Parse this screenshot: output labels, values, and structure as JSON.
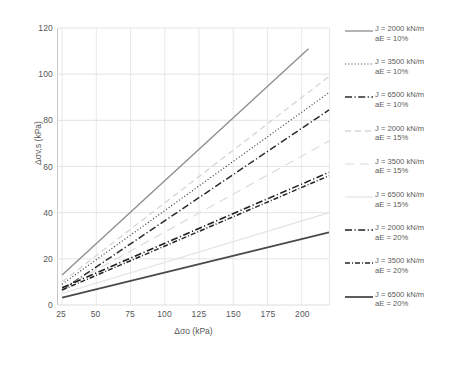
{
  "chart_data": {
    "type": "line",
    "title": "",
    "xlabel": "Δσo (kPa)",
    "ylabel": "Δσv,s (kPa)",
    "xlim": [
      22,
      220
    ],
    "ylim": [
      0,
      120
    ],
    "xticks": [
      25,
      50,
      75,
      100,
      125,
      150,
      175,
      200
    ],
    "yticks": [
      0,
      20,
      40,
      60,
      80,
      100,
      120
    ],
    "grid": true,
    "legend_position": "right",
    "x": [
      25,
      220
    ],
    "series": [
      {
        "name": "J = 2000 kN/m\naE = 10%",
        "label_line1": "J = 2000 kN/m",
        "label_line2": "aE = 10%",
        "J": 2000,
        "aE": "10%",
        "values": [
          13.0,
          120.0
        ],
        "x_end": 205,
        "y_end": 111.0,
        "color": "#8c8c8c",
        "style": "solid",
        "width": 1.3
      },
      {
        "name": "J = 3500 kN/m\naE = 10%",
        "label_line1": "J = 3500 kN/m",
        "label_line2": "aE = 10%",
        "J": 3500,
        "aE": "10%",
        "values": [
          9.0,
          92.0
        ],
        "x_end": 220,
        "y_end": 92.0,
        "color": "#3a3a3a",
        "style": "dotted",
        "width": 1.2
      },
      {
        "name": "J = 6500 kN/m\naE = 10%",
        "label_line1": "J = 6500 kN/m",
        "label_line2": "aE = 10%",
        "J": 6500,
        "aE": "10%",
        "values": [
          6.5,
          84.5
        ],
        "x_end": 220,
        "y_end": 84.5,
        "color": "#2b2b2b",
        "style": "dashdot-bold",
        "width": 1.5
      },
      {
        "name": "J = 2000 kN/m\naE = 15%",
        "label_line1": "J = 2000 kN/m",
        "label_line2": "aE = 15%",
        "J": 2000,
        "aE": "15%",
        "values": [
          10.0,
          99.0
        ],
        "x_end": 220,
        "y_end": 99.0,
        "color": "#d6d6d6",
        "style": "dashed",
        "width": 1.3
      },
      {
        "name": "J = 3500 kN/m\naE = 15%",
        "label_line1": "J = 3500 kN/m",
        "label_line2": "aE = 15%",
        "J": 3500,
        "aE": "15%",
        "values": [
          7.0,
          71.0
        ],
        "x_end": 220,
        "y_end": 71.0,
        "color": "#dcdcdc",
        "style": "dashed-long",
        "width": 1.2
      },
      {
        "name": "J = 6500 kN/m\naE = 15%",
        "label_line1": "J = 6500 kN/m",
        "label_line2": "aE = 15%",
        "J": 6500,
        "aE": "15%",
        "values": [
          5.0,
          40.0
        ],
        "x_end": 220,
        "y_end": 40.0,
        "color": "#e3e3e3",
        "style": "solid-light",
        "width": 1.2
      },
      {
        "name": "J = 2000 kN/m\naE = 20%",
        "label_line1": "J = 2000 kN/m",
        "label_line2": "aE = 20%",
        "J": 2000,
        "aE": "20%",
        "values": [
          7.5,
          57.5
        ],
        "x_end": 220,
        "y_end": 57.5,
        "color": "#1f1f1f",
        "style": "dashdot-bold",
        "width": 1.6
      },
      {
        "name": "J = 3500 kN/m\naE = 20%",
        "label_line1": "J = 3500 kN/m",
        "label_line2": "aE = 20%",
        "J": 3500,
        "aE": "20%",
        "values": [
          6.5,
          56.0
        ],
        "x_end": 220,
        "y_end": 56.0,
        "color": "#262626",
        "style": "dashdot-fine",
        "width": 1.5
      },
      {
        "name": "J = 6500 kN/m\naE = 20%",
        "label_line1": "J = 6500 kN/m",
        "label_line2": "aE = 20%",
        "J": 6500,
        "aE": "20%",
        "values": [
          3.2,
          31.5
        ],
        "x_end": 220,
        "y_end": 31.5,
        "color": "#4a4a4a",
        "style": "solid",
        "width": 1.8
      }
    ]
  },
  "caption": {
    "text": ""
  }
}
